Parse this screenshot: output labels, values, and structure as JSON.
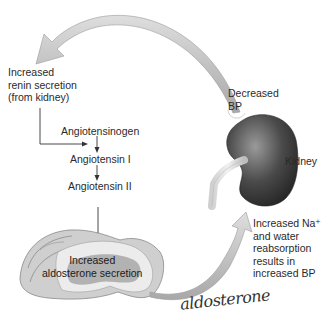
{
  "diagram": {
    "type": "renin-angiotensin-aldosterone pathway",
    "labels": {
      "renin": "Increased\nrenin secretion\n(from kidney)",
      "decreased_bp": "Decreased\nBP",
      "angiotensinogen": "Angiotensinogen",
      "angiotensin1": "Angiotensin I",
      "angiotensin2": "Angiotensin II",
      "kidney": "Kidney",
      "aldosterone_secretion": "Increased\naldosterone secretion",
      "result": "Increased Na⁺\nand water\nreabsorption\nresults in\nincreased BP",
      "handwritten": "aldosterone"
    },
    "colors": {
      "arrow_fill": "#c8c8c8",
      "arrow_edge": "#9a9a9a",
      "kidney_dark": "#3a3a3a",
      "kidney_light": "#8a8a8a",
      "gland_outer": "#bdbdbd",
      "gland_inner": "#e6e6e6",
      "gland_core": "#9e9e9e"
    }
  }
}
